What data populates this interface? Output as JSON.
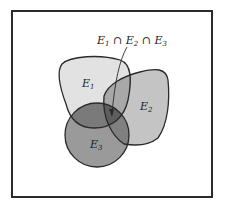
{
  "diagram": {
    "type": "venn",
    "sets": [
      {
        "id": "E1",
        "label": "E",
        "sub": "1",
        "fill": "#e2e2e2"
      },
      {
        "id": "E2",
        "label": "E",
        "sub": "2",
        "fill": "#c4c4c4"
      },
      {
        "id": "E3",
        "label": "E",
        "sub": "3",
        "fill": "#9a9a9a"
      }
    ],
    "annotation": {
      "parts": [
        "E",
        "1",
        " ∩ ",
        "E",
        "2",
        " ∩ ",
        "E",
        "3"
      ]
    },
    "colors": {
      "frame": "#2a2a2a",
      "stroke": "#2a2a2a",
      "e1e3": "#7a7a7a",
      "e2e3": "#808080",
      "e1e2": "#a8a8a8",
      "triple": "#5e5e5e"
    }
  }
}
